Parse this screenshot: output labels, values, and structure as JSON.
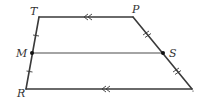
{
  "diagram": {
    "type": "trapezoid-midsegment",
    "labels": {
      "T": "T",
      "P": "P",
      "M": "M",
      "S": "S",
      "R": "R"
    },
    "vertices": {
      "T": [
        39,
        17
      ],
      "P": [
        133,
        17
      ],
      "M": [
        32,
        53
      ],
      "S": [
        163,
        53
      ],
      "R": [
        26,
        89
      ],
      "Q": [
        192,
        89
      ]
    },
    "segments": [
      {
        "from": "T",
        "to": "P",
        "mark": "double-arrow"
      },
      {
        "from": "R",
        "to": "Q",
        "mark": "double-arrow"
      },
      {
        "from": "T",
        "to": "M",
        "mark": "single-tick"
      },
      {
        "from": "M",
        "to": "R",
        "mark": "single-tick"
      },
      {
        "from": "P",
        "to": "S",
        "mark": "double-tick"
      },
      {
        "from": "S",
        "to": "Q",
        "mark": "double-tick"
      },
      {
        "from": "M",
        "to": "S",
        "mark": "none"
      }
    ],
    "points": [
      "M",
      "S"
    ],
    "colors": {
      "line": "#3a3a3a",
      "point": "#111111",
      "label": "#333333"
    }
  }
}
